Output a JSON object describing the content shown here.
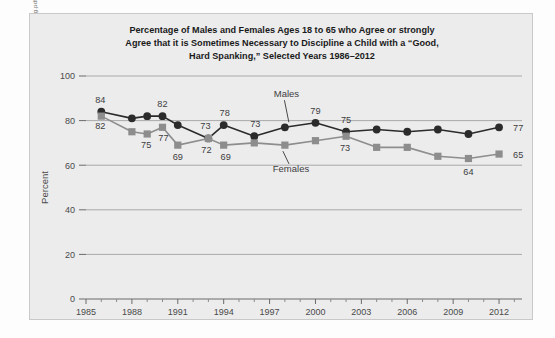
{
  "source_url": "http://www.childtrends.org/wp-content/uploads/2012/10/51_Attitudes_Toward_Spanking.pdf",
  "title_lines": [
    "Percentage of Males and Females Ages 18 to 65 who Agree or strongly",
    "Agree that it is Sometimes Necessary to Discipline a Child with a “Good,",
    "Hard Spanking,” Selected Years 1986–2012"
  ],
  "colors": {
    "panel_background": "#ececed",
    "panel_border": "#c9c9c9",
    "gridline": "#a9a9a9",
    "males_series": "#2b2b2b",
    "females_series": "#8d8d8d",
    "text": "#3d3d3d"
  },
  "chart_data": {
    "type": "line",
    "title": "Percentage of Males and Females Ages 18 to 65 who Agree or strongly Agree that it is Sometimes Necessary to Discipline a Child with a “Good, Hard Spanking,” Selected Years 1986–2012",
    "xlabel": "",
    "ylabel": "Percent",
    "xlim": [
      1985,
      2013.5
    ],
    "ylim": [
      0,
      100
    ],
    "grid": true,
    "legend_position": "inline-annotation",
    "xticks": [
      1985,
      1988,
      1991,
      1994,
      1997,
      2000,
      2003,
      2006,
      2009,
      2012
    ],
    "xtick_labels": [
      "1985",
      "1988",
      "1991",
      "1994",
      "1997",
      "2000",
      "2003",
      "2006",
      "2009",
      "2012"
    ],
    "yticks": [
      0,
      20,
      40,
      60,
      80,
      100
    ],
    "ytick_labels": [
      "0",
      "20",
      "40",
      "60",
      "80",
      "100"
    ],
    "x": [
      1986,
      1988,
      1989,
      1990,
      1991,
      1993,
      1994,
      1996,
      1998,
      2000,
      2002,
      2004,
      2006,
      2008,
      2010,
      2012
    ],
    "series": [
      {
        "name": "Males",
        "marker": "circle",
        "color": "#2b2b2b",
        "values": [
          84,
          81,
          82,
          82,
          78,
          72,
          78,
          73,
          77,
          79,
          75,
          76,
          75,
          76,
          74,
          77
        ]
      },
      {
        "name": "Females",
        "marker": "square",
        "color": "#8d8d8d",
        "values": [
          82,
          75,
          74,
          77,
          69,
          72,
          69,
          70,
          69,
          71,
          73,
          68,
          68,
          64,
          63,
          65
        ]
      }
    ],
    "point_labels": [
      {
        "series": "Males",
        "x": 1986,
        "value": 84,
        "text": "84",
        "dx": -1,
        "dy": -9
      },
      {
        "series": "Females",
        "x": 1986,
        "value": 82,
        "text": "82",
        "dx": -1,
        "dy": 13
      },
      {
        "series": "Males",
        "x": 1990,
        "value": 82,
        "text": "82",
        "dx": 0,
        "dy": -9
      },
      {
        "series": "Females",
        "x": 1989,
        "value": 74,
        "text": "75",
        "dx": -1,
        "dy": 14
      },
      {
        "series": "Females",
        "x": 1990,
        "value": 77,
        "text": "77",
        "dx": 1,
        "dy": 14
      },
      {
        "series": "Females",
        "x": 1991,
        "value": 69,
        "text": "69",
        "dx": 0,
        "dy": 15
      },
      {
        "series": "Females",
        "x": 1993,
        "value": 72,
        "text": "72",
        "dx": -2,
        "dy": 15
      },
      {
        "series": "Males",
        "x": 1993,
        "value": 72,
        "text": "73",
        "dx": -3,
        "dy": -9
      },
      {
        "series": "Males",
        "x": 1994,
        "value": 78,
        "text": "78",
        "dx": 1,
        "dy": -9
      },
      {
        "series": "Females",
        "x": 1994,
        "value": 69,
        "text": "69",
        "dx": 2,
        "dy": 15
      },
      {
        "series": "Males",
        "x": 1996,
        "value": 73,
        "text": "73",
        "dx": 1,
        "dy": -9
      },
      {
        "series": "Males",
        "x": 2000,
        "value": 79,
        "text": "79",
        "dx": 0,
        "dy": -9
      },
      {
        "series": "Males",
        "x": 2002,
        "value": 75,
        "text": "75",
        "dx": 0,
        "dy": -9
      },
      {
        "series": "Females",
        "x": 2002,
        "value": 73,
        "text": "73",
        "dx": -1,
        "dy": 15
      },
      {
        "series": "Females",
        "x": 2010,
        "value": 63,
        "text": "64",
        "dx": 0,
        "dy": 16
      },
      {
        "series": "Males",
        "x": 2012,
        "value": 77,
        "text": "77",
        "dx": 14,
        "dy": 4
      },
      {
        "series": "Females",
        "x": 2012,
        "value": 65,
        "text": "65",
        "dx": 14,
        "dy": 4
      }
    ],
    "annotations": [
      {
        "text": "Males",
        "label_x": 1998.1,
        "label_y": 90.5,
        "point_x": 1998,
        "point_y": 77
      },
      {
        "text": "Females",
        "label_x": 1998.4,
        "label_y": 57.0,
        "point_x": 1998,
        "point_y": 69
      }
    ]
  }
}
